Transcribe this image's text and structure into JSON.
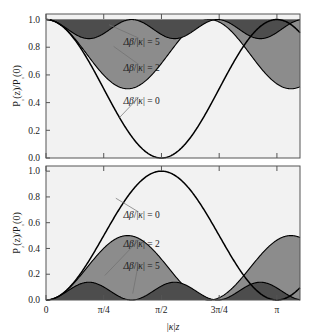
{
  "figure": {
    "name": "directional-coupler-power-transfer",
    "xlabel": "|κ|z",
    "x_ticks": [
      {
        "value": 0.0,
        "label": "0"
      },
      {
        "value": 0.7853981634,
        "label": "π/4"
      },
      {
        "value": 1.5707963268,
        "label": "π/2"
      },
      {
        "value": 2.3561944902,
        "label": "3π/4"
      },
      {
        "value": 3.1415926536,
        "label": "π"
      }
    ],
    "y_ticks": [
      {
        "value": 0.0,
        "label": "0.0"
      },
      {
        "value": 0.2,
        "label": "0.2"
      },
      {
        "value": 0.4,
        "label": "0.4"
      },
      {
        "value": 0.6,
        "label": "0.6"
      },
      {
        "value": 0.8,
        "label": "0.8"
      },
      {
        "value": 1.0,
        "label": "1.0"
      }
    ],
    "colors": {
      "curve": "#000000",
      "fill_delta2": "#8c8c8c",
      "fill_delta5": "#4d4d4d",
      "panel_background": "#f2f2f2",
      "axis": "#555555",
      "leader_line": "#707070"
    }
  },
  "chart_data": [
    {
      "type": "line",
      "panel": "upper",
      "title": "",
      "xlabel": "|κ|z",
      "ylabel": "P₁(z)/P₁(0)",
      "xlim": [
        0,
        3.4557519189
      ],
      "ylim": [
        0,
        1.04
      ],
      "grid": false,
      "legend_position": "inline-annotations",
      "annotations": [
        {
          "text": "Δβ/|κ| = 5",
          "x": 1.3,
          "y": 0.845,
          "target_x": 0.86,
          "target_y": 0.962
        },
        {
          "text": "Δβ/|κ| = 2",
          "x": 1.3,
          "y": 0.655,
          "target_x": 0.92,
          "target_y": 0.806
        },
        {
          "text": "Δβ/|κ| = 0",
          "x": 1.3,
          "y": 0.415,
          "target_x": 1.0,
          "target_y": 0.292
        }
      ],
      "series": [
        {
          "name": "Δβ/|κ| = 0",
          "delta_beta_over_kappa": 0,
          "peak_transfer": 1.0,
          "min_value": 0.0,
          "max_value": 1.0,
          "period": 3.1415926536,
          "fill": "none"
        },
        {
          "name": "Δβ/|κ| = 2",
          "delta_beta_over_kappa": 2,
          "peak_transfer": 0.2,
          "min_value": 0.8,
          "max_value": 1.0,
          "period": 2.2214414691,
          "fill": "fill_delta2"
        },
        {
          "name": "Δβ/|κ| = 5",
          "delta_beta_over_kappa": 5,
          "peak_transfer": 0.0384615,
          "min_value": 0.9615385,
          "max_value": 1.0,
          "period": 1.1670693892,
          "fill": "fill_delta5"
        }
      ]
    },
    {
      "type": "line",
      "panel": "lower",
      "title": "",
      "xlabel": "|κ|z",
      "ylabel": "P₂(z)/P₁(0)",
      "xlim": [
        0,
        3.4557519189
      ],
      "ylim": [
        0,
        1.04
      ],
      "grid": false,
      "legend_position": "inline-annotations",
      "annotations": [
        {
          "text": "Δβ/|κ| = 0",
          "x": 1.3,
          "y": 0.66,
          "target_x": 0.95,
          "target_y": 0.79
        },
        {
          "text": "Δβ/|κ| = 2",
          "x": 1.3,
          "y": 0.44,
          "target_x": 0.8,
          "target_y": 0.19
        },
        {
          "text": "Δβ/|κ| = 5",
          "x": 1.3,
          "y": 0.265,
          "target_x": 1.18,
          "target_y": 0.05
        }
      ],
      "series": [
        {
          "name": "Δβ/|κ| = 0",
          "delta_beta_over_kappa": 0,
          "peak_transfer": 1.0,
          "min_value": 0.0,
          "max_value": 1.0,
          "period": 3.1415926536,
          "fill": "none"
        },
        {
          "name": "Δβ/|κ| = 2",
          "delta_beta_over_kappa": 2,
          "peak_transfer": 0.2,
          "min_value": 0.0,
          "max_value": 0.2,
          "period": 2.2214414691,
          "fill": "fill_delta2"
        },
        {
          "name": "Δβ/|κ| = 5",
          "delta_beta_over_kappa": 5,
          "peak_transfer": 0.0384615,
          "min_value": 0.0,
          "max_value": 0.0384615,
          "period": 1.1670693892,
          "fill": "fill_delta5"
        }
      ]
    }
  ]
}
